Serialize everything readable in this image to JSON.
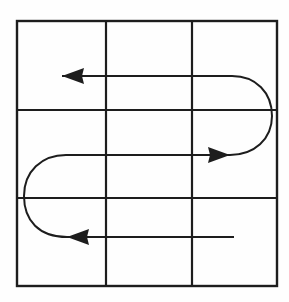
{
  "figure": {
    "title": "Boustrophedon serpentine coverage path over a 3x3 grid",
    "width": 289,
    "height": 302,
    "background_color": "#fefefe",
    "line_color": "#1d1d1d"
  },
  "grid": {
    "name": "3x3-cell-grid",
    "rows": 3,
    "columns": 3,
    "border": {
      "left": 17,
      "top": 21,
      "right": 277,
      "bottom": 286,
      "stroke_width": 2.4
    },
    "vertical_lines_x": [
      106,
      192
    ],
    "horizontal_lines_y": [
      110,
      198
    ],
    "stroke_width": 2.2
  },
  "path": {
    "name": "serpentine-path",
    "type": "boustrophedon",
    "stroke_width": 2.0,
    "pass_count": 3,
    "turn_count": 2,
    "start_point": {
      "x": 234,
      "y": 237
    },
    "segments": [
      {
        "name": "bottom-pass",
        "direction": "leftward",
        "y": 237,
        "x_start": 234,
        "x_end": 67,
        "has_arrow": true,
        "arrow_tip": {
          "x": 67,
          "y": 237
        }
      },
      {
        "name": "left-u-turn",
        "direction": "counterclockwise",
        "center": {
          "x": 66,
          "y": 196
        },
        "radius_x": 42,
        "radius_y": 41,
        "extreme_x": 24,
        "from_y": 237,
        "to_y": 155
      },
      {
        "name": "middle-pass",
        "direction": "rightward",
        "y": 155,
        "x_start": 66,
        "x_end": 230,
        "has_arrow": true,
        "arrow_tip": {
          "x": 230,
          "y": 155
        }
      },
      {
        "name": "right-u-turn",
        "direction": "clockwise",
        "center": {
          "x": 232,
          "y": 116
        },
        "radius_x": 40,
        "radius_y": 39,
        "extreme_x": 272,
        "from_y": 155,
        "to_y": 76
      },
      {
        "name": "top-pass",
        "direction": "leftward",
        "y": 76,
        "x_start": 232,
        "x_end": 62,
        "has_arrow": true,
        "arrow_tip": {
          "x": 62,
          "y": 76
        }
      }
    ],
    "arrows": [
      {
        "name": "top-arrowhead",
        "points_toward": "left",
        "tip_x": 62,
        "tip_y": 76
      },
      {
        "name": "middle-arrowhead",
        "points_toward": "right",
        "tip_x": 230,
        "tip_y": 155
      },
      {
        "name": "bottom-arrowhead",
        "points_toward": "left",
        "tip_x": 67,
        "tip_y": 237
      }
    ]
  }
}
